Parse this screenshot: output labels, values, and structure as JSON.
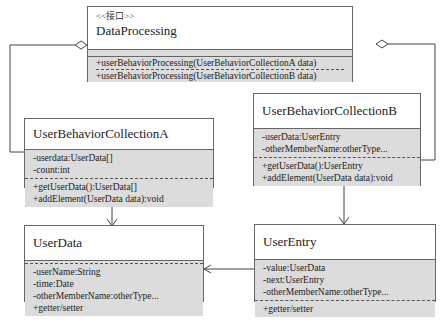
{
  "diagram": {
    "type": "UML class diagram",
    "classes": {
      "dataProcessing": {
        "stereotype": "<<接口>>",
        "name": "DataProcessing",
        "attributes": [],
        "operations": [
          "+userBehaviorProcessing(UserBehaviorCollectionA data)",
          "+userBehaviorProcessing(UserBehaviorCollectionB data)"
        ]
      },
      "collectionA": {
        "name": "UserBehaviorCollectionA",
        "attributes": [
          "-userdata:UserData[]",
          "-count:int"
        ],
        "operations": [
          "+getUserData():UserData[]",
          "+addElement(UserData data):void"
        ]
      },
      "collectionB": {
        "name": "UserBehaviorCollectionB",
        "attributes": [
          "-userData:UserEntry",
          "-otherMemberName:otherType..."
        ],
        "operations": [
          "+getUserData():UserEntry",
          "+addElement(UserData data):void"
        ]
      },
      "userData": {
        "name": "UserData",
        "attributes": [
          "-userName:String",
          "-time:Date",
          "-otherMemberName:otherType...",
          "+getter/setter"
        ],
        "operations": []
      },
      "userEntry": {
        "name": "UserEntry",
        "attributes": [
          "-value:UserData",
          "-next:UserEntry",
          "-otherMemberName:otherType..."
        ],
        "operations": [
          "+getter/setter"
        ]
      }
    },
    "relations": [
      {
        "from": "DataProcessing",
        "to": "UserBehaviorCollectionA",
        "type": "aggregation"
      },
      {
        "from": "DataProcessing",
        "to": "UserBehaviorCollectionB",
        "type": "aggregation"
      },
      {
        "from": "UserBehaviorCollectionA",
        "to": "UserData",
        "type": "association"
      },
      {
        "from": "UserBehaviorCollectionB",
        "to": "UserEntry",
        "type": "association"
      },
      {
        "from": "UserEntry",
        "to": "UserData",
        "type": "association"
      }
    ]
  }
}
